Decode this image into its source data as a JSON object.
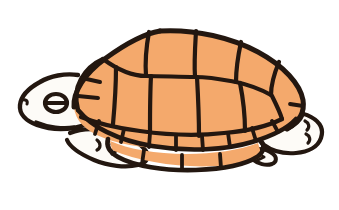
{
  "image": {
    "subject": "turtle",
    "style": "clip-art line drawing with flat color fill",
    "orientation": "side profile facing left",
    "background_color": "#ffffff",
    "width": 339,
    "height": 210,
    "alt_text": "Cartoon clip-art turtle in side profile facing left, with an orange segmented domed shell, cream head and legs, and a heavy dark brown outline."
  },
  "palette": {
    "background": "#ffffff",
    "shell_orange": "#f4a96c",
    "skin_cream": "#fdfbf7",
    "outline_dark": "#231710",
    "eye_dark": "#231710"
  },
  "parts": [
    {
      "id": "carapace",
      "label": "Carapace (upper shell dome)",
      "color": "#f4a96c",
      "description": "Large domed oval shell occupying the upper center and right of the frame"
    },
    {
      "id": "vertebral-scutes",
      "label": "Vertebral scutes",
      "color": "#f4a96c",
      "count": 5,
      "description": "Central row of large plates running along the top of the dome"
    },
    {
      "id": "costal-scutes",
      "label": "Costal scutes",
      "color": "#f4a96c",
      "count": 8,
      "description": "Side plates flanking the central vertebral row"
    },
    {
      "id": "marginal-scutes-upper",
      "label": "Upper marginal scutes",
      "color": "#f4a96c",
      "count": 11,
      "description": "Narrow band of small rectangular plates along the lower rim of the carapace"
    },
    {
      "id": "plastron-edge",
      "label": "Lower shell rim scutes",
      "color": "#f4a96c",
      "count": 5,
      "description": "Second lower band of wide plates forming the visible bottom shell edge"
    },
    {
      "id": "head",
      "label": "Head",
      "color": "#fdfbf7",
      "description": "Cream rounded head at the far left with a blunt snout"
    },
    {
      "id": "eye",
      "label": "Eye",
      "color": "#231710",
      "description": "Dark oval eye with a horizontal slit pupil line through it"
    },
    {
      "id": "nostril",
      "label": "Nostril notch",
      "color": "#231710",
      "description": "Small notch mark on the tip of the snout"
    },
    {
      "id": "neck",
      "label": "Neck",
      "color": "#fdfbf7",
      "description": "Short cream neck joining the head to the shell opening"
    },
    {
      "id": "front-leg",
      "label": "Front leg",
      "color": "#fdfbf7",
      "description": "Cream foreleg tucked beneath the left underside of the shell"
    },
    {
      "id": "rear-leg",
      "label": "Rear leg",
      "color": "#fdfbf7",
      "description": "Cream hind leg emerging at the lower right of the shell"
    },
    {
      "id": "tail",
      "label": "Tail",
      "color": "#fdfbf7",
      "description": "Short pointed tail at the bottom right below the rear leg"
    }
  ]
}
